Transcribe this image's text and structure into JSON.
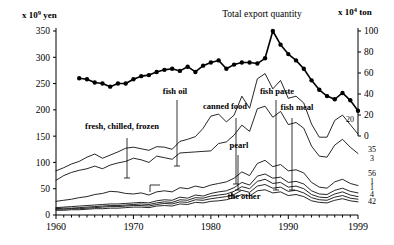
{
  "chart_data": {
    "type": "line",
    "title": "Total export quantity",
    "ylabel_left": "x 10",
    "ylabel_left_exp": "9",
    "ylabel_left_unit": "yen",
    "ylabel_right": "x 10",
    "ylabel_right_exp": "4",
    "ylabel_right_unit": "ton",
    "xlabel": "",
    "xlim": [
      1960,
      1999
    ],
    "ylim_left": [
      0,
      350
    ],
    "ylim_right": [
      0,
      100
    ],
    "grid": false,
    "legend_position": "inline-annotations",
    "yticks_left": [
      "0",
      "50",
      "100",
      "150",
      "200",
      "250",
      "300",
      "350"
    ],
    "yticks_left_values": [
      0,
      50,
      100,
      150,
      200,
      250,
      300,
      350
    ],
    "yticks_right": [
      "0",
      "20",
      "40",
      "60",
      "80",
      "100"
    ],
    "yticks_right_values": [
      0,
      20,
      40,
      60,
      80,
      100
    ],
    "xticks": [
      "1960",
      "1970",
      "1980",
      "1990",
      "1999"
    ],
    "xticks_values": [
      1960,
      1970,
      1980,
      1990,
      1999
    ],
    "annotations": [
      {
        "label": "fresh, chilled, frozen",
        "x": 122,
        "y": 129
      },
      {
        "label": "fish oil",
        "x": 175,
        "y": 94
      },
      {
        "label": "canned food",
        "x": 225,
        "y": 109
      },
      {
        "label": "pearl",
        "x": 239,
        "y": 148
      },
      {
        "label": "fish paste",
        "x": 277,
        "y": 94
      },
      {
        "label": "fish meal",
        "x": 297,
        "y": 110
      },
      {
        "label": "the other",
        "x": 244,
        "y": 199
      }
    ],
    "end_labels": [
      {
        "text": "20",
        "value": 20,
        "y": 122
      },
      {
        "text": "35",
        "value": 35,
        "y": 152
      },
      {
        "text": "3",
        "value": 3,
        "y": 161
      },
      {
        "text": "56",
        "value": 56,
        "y": 176
      },
      {
        "text": "1",
        "value": 1,
        "y": 184
      },
      {
        "text": "1",
        "value": 1,
        "y": 190
      },
      {
        "text": "4",
        "value": 4,
        "y": 197
      },
      {
        "text": "42",
        "value": 42,
        "y": 204
      }
    ],
    "series": [
      {
        "name": "Total export quantity",
        "axis": "right",
        "style": "marker-line",
        "x": [
          1963,
          1964,
          1965,
          1966,
          1967,
          1968,
          1969,
          1970,
          1971,
          1972,
          1973,
          1974,
          1975,
          1976,
          1977,
          1978,
          1979,
          1980,
          1981,
          1982,
          1983,
          1984,
          1985,
          1986,
          1987,
          1988,
          1989,
          1990,
          1991,
          1992,
          1993,
          1994,
          1995,
          1996,
          1997,
          1998,
          1999
        ],
        "values": [
          55,
          54,
          51,
          50,
          47,
          50,
          50,
          54,
          57,
          58,
          61,
          63,
          64,
          62,
          66,
          61,
          67,
          70,
          72,
          64,
          68,
          70,
          70,
          69,
          74,
          100,
          87,
          78,
          72,
          64,
          53,
          44,
          38,
          35,
          41,
          34,
          24
        ]
      },
      {
        "name": "fresh, chilled, frozen",
        "axis": "left",
        "style": "line",
        "x": [
          1960,
          1961,
          1962,
          1963,
          1964,
          1965,
          1966,
          1967,
          1968,
          1969,
          1970,
          1971,
          1972,
          1973,
          1974,
          1975,
          1976,
          1977,
          1978,
          1979,
          1980,
          1981,
          1982,
          1983,
          1984,
          1985,
          1986,
          1987,
          1988,
          1989,
          1990,
          1991,
          1992,
          1993,
          1994,
          1995,
          1996,
          1997,
          1998,
          1999
        ],
        "values": [
          84,
          90,
          97,
          102,
          110,
          116,
          108,
          114,
          120,
          127,
          129,
          126,
          123,
          130,
          129,
          125,
          140,
          144,
          149,
          165,
          188,
          192,
          177,
          190,
          226,
          203,
          259,
          269,
          240,
          256,
          222,
          226,
          213,
          173,
          148,
          148,
          180,
          190,
          172,
          154
        ]
      },
      {
        "name": "fish oil",
        "axis": "left",
        "style": "line",
        "x": [
          1960,
          1961,
          1962,
          1963,
          1964,
          1965,
          1966,
          1967,
          1968,
          1969,
          1970,
          1971,
          1972,
          1973,
          1974,
          1975,
          1976,
          1977,
          1978,
          1979,
          1980,
          1981,
          1982,
          1983,
          1984,
          1985,
          1986,
          1987,
          1988,
          1989,
          1990,
          1991,
          1992,
          1993,
          1994,
          1995,
          1996,
          1997,
          1998,
          1999
        ],
        "values": [
          66,
          75,
          81,
          85,
          88,
          93,
          88,
          95,
          99,
          102,
          108,
          105,
          100,
          112,
          109,
          106,
          118,
          119,
          120,
          121,
          122,
          136,
          139,
          152,
          171,
          159,
          202,
          207,
          186,
          197,
          172,
          176,
          165,
          131,
          112,
          110,
          133,
          144,
          129,
          117
        ]
      },
      {
        "name": "canned food",
        "axis": "left",
        "style": "line",
        "x": [
          1960,
          1961,
          1962,
          1963,
          1964,
          1965,
          1966,
          1967,
          1968,
          1969,
          1970,
          1971,
          1972,
          1973,
          1974,
          1975,
          1976,
          1977,
          1978,
          1979,
          1980,
          1981,
          1982,
          1983,
          1984,
          1985,
          1986,
          1987,
          1988,
          1989,
          1990,
          1991,
          1992,
          1993,
          1994,
          1995,
          1996,
          1997,
          1998,
          1999
        ],
        "values": [
          26,
          28,
          30,
          33,
          35,
          39,
          41,
          45,
          44,
          41,
          40,
          42,
          38,
          44,
          46,
          44,
          52,
          50,
          55,
          52,
          57,
          60,
          63,
          70,
          82,
          75,
          98,
          104,
          92,
          96,
          84,
          86,
          80,
          62,
          53,
          51,
          63,
          68,
          60,
          56
        ]
      },
      {
        "name": "pearl",
        "axis": "left",
        "style": "line",
        "x": [
          1960,
          1961,
          1962,
          1963,
          1964,
          1965,
          1966,
          1967,
          1968,
          1969,
          1970,
          1971,
          1972,
          1973,
          1974,
          1975,
          1976,
          1977,
          1978,
          1979,
          1980,
          1981,
          1982,
          1983,
          1984,
          1985,
          1986,
          1987,
          1988,
          1989,
          1990,
          1991,
          1992,
          1993,
          1994,
          1995,
          1996,
          1997,
          1998,
          1999
        ],
        "values": [
          14,
          15,
          16,
          17,
          18,
          19,
          20,
          21,
          21,
          22,
          23,
          24,
          23,
          27,
          29,
          28,
          34,
          32,
          38,
          36,
          41,
          44,
          46,
          52,
          62,
          57,
          74,
          78,
          70,
          72,
          62,
          64,
          59,
          46,
          40,
          39,
          47,
          51,
          45,
          42
        ]
      },
      {
        "name": "fish paste",
        "axis": "left",
        "style": "line",
        "x": [
          1960,
          1961,
          1962,
          1963,
          1964,
          1965,
          1966,
          1967,
          1968,
          1969,
          1970,
          1971,
          1972,
          1973,
          1974,
          1975,
          1976,
          1977,
          1978,
          1979,
          1980,
          1981,
          1982,
          1983,
          1984,
          1985,
          1986,
          1987,
          1988,
          1989,
          1990,
          1991,
          1992,
          1993,
          1994,
          1995,
          1996,
          1997,
          1998,
          1999
        ],
        "values": [
          12,
          13,
          13,
          14,
          15,
          16,
          17,
          18,
          18,
          19,
          20,
          21,
          20,
          23,
          25,
          24,
          29,
          28,
          33,
          32,
          36,
          38,
          40,
          45,
          54,
          50,
          64,
          68,
          60,
          62,
          53,
          55,
          50,
          39,
          34,
          33,
          40,
          44,
          38,
          35
        ]
      },
      {
        "name": "fish meal",
        "axis": "left",
        "style": "line",
        "x": [
          1960,
          1961,
          1962,
          1963,
          1964,
          1965,
          1966,
          1967,
          1968,
          1969,
          1970,
          1971,
          1972,
          1973,
          1974,
          1975,
          1976,
          1977,
          1978,
          1979,
          1980,
          1981,
          1982,
          1983,
          1984,
          1985,
          1986,
          1987,
          1988,
          1989,
          1990,
          1991,
          1992,
          1993,
          1994,
          1995,
          1996,
          1997,
          1998,
          1999
        ],
        "values": [
          11,
          11,
          12,
          12,
          13,
          14,
          15,
          16,
          16,
          17,
          18,
          18,
          17,
          20,
          22,
          21,
          25,
          24,
          29,
          28,
          31,
          33,
          35,
          39,
          47,
          43,
          55,
          58,
          51,
          53,
          45,
          47,
          42,
          33,
          29,
          28,
          34,
          37,
          32,
          30
        ]
      },
      {
        "name": "the other",
        "axis": "left",
        "style": "line",
        "x": [
          1960,
          1961,
          1962,
          1963,
          1964,
          1965,
          1966,
          1967,
          1968,
          1969,
          1970,
          1971,
          1972,
          1973,
          1974,
          1975,
          1976,
          1977,
          1978,
          1979,
          1980,
          1981,
          1982,
          1983,
          1984,
          1985,
          1986,
          1987,
          1988,
          1989,
          1990,
          1991,
          1992,
          1993,
          1994,
          1995,
          1996,
          1997,
          1998,
          1999
        ],
        "values": [
          9,
          9,
          10,
          10,
          11,
          12,
          12,
          13,
          13,
          14,
          15,
          15,
          14,
          17,
          18,
          17,
          21,
          20,
          24,
          23,
          26,
          27,
          29,
          33,
          39,
          36,
          46,
          48,
          42,
          44,
          37,
          39,
          35,
          27,
          24,
          23,
          28,
          31,
          27,
          25
        ]
      }
    ]
  }
}
